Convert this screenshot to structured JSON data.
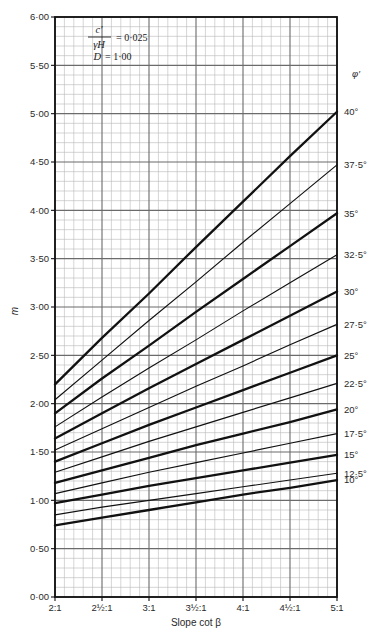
{
  "chart_data": {
    "type": "line",
    "title": "",
    "xlabel": "Slope cot β",
    "ylabel": "m",
    "xlim": [
      2,
      5
    ],
    "ylim": [
      0,
      6
    ],
    "grid": true,
    "legend_position": "right-outside",
    "x_tick_labels": [
      "2:1",
      "2½:1",
      "3:1",
      "3½:1",
      "4:1",
      "4½:1",
      "5:1"
    ],
    "x_tick_values": [
      2,
      2.5,
      3,
      3.5,
      4,
      4.5,
      5
    ],
    "y_tick_labels": [
      "0·00",
      "0·50",
      "1·00",
      "1·50",
      "2·00",
      "2·50",
      "3·00",
      "3·50",
      "4·00",
      "4·50",
      "5·00",
      "5·50",
      "6·00"
    ],
    "y_tick_values": [
      0,
      0.5,
      1,
      1.5,
      2,
      2.5,
      3,
      3.5,
      4,
      4.5,
      5,
      5.5,
      6
    ],
    "y_major_step": 0.5,
    "y_minor_step": 0.1,
    "x_major_step": 0.5,
    "x_minor_step": 0.1,
    "legend_title": "φ′",
    "annotation": {
      "numerator": "c′",
      "denominator": "γH",
      "eq1": "= 0·025",
      "line2_symbol": "D",
      "line2_value": "= 1·00"
    },
    "series": [
      {
        "name": "40°",
        "label": "40°",
        "weight": "thick",
        "x": [
          2,
          2.5,
          3,
          3.5,
          4,
          4.5,
          5
        ],
        "values": [
          2.2,
          2.68,
          3.14,
          3.62,
          4.09,
          4.56,
          5.02
        ]
      },
      {
        "name": "37.5°",
        "label": "37·5°",
        "weight": "thin",
        "x": [
          2,
          2.5,
          3,
          3.5,
          4,
          4.5,
          5
        ],
        "values": [
          2.04,
          2.45,
          2.86,
          3.26,
          3.67,
          4.07,
          4.47
        ]
      },
      {
        "name": "35°",
        "label": "35°",
        "weight": "thick",
        "x": [
          2,
          2.5,
          3,
          3.5,
          4,
          4.5,
          5
        ],
        "values": [
          1.9,
          2.26,
          2.6,
          2.95,
          3.29,
          3.63,
          3.97
        ]
      },
      {
        "name": "32.5°",
        "label": "32·5°",
        "weight": "thin",
        "x": [
          2,
          2.5,
          3,
          3.5,
          4,
          4.5,
          5
        ],
        "values": [
          1.76,
          2.07,
          2.37,
          2.66,
          2.96,
          3.25,
          3.54
        ]
      },
      {
        "name": "30°",
        "label": "30°",
        "weight": "thick",
        "x": [
          2,
          2.5,
          3,
          3.5,
          4,
          4.5,
          5
        ],
        "values": [
          1.64,
          1.9,
          2.16,
          2.41,
          2.66,
          2.91,
          3.16
        ]
      },
      {
        "name": "27.5°",
        "label": "27·5°",
        "weight": "thin",
        "x": [
          2,
          2.5,
          3,
          3.5,
          4,
          4.5,
          5
        ],
        "values": [
          1.52,
          1.74,
          1.96,
          2.18,
          2.39,
          2.61,
          2.82
        ]
      },
      {
        "name": "25°",
        "label": "25°",
        "weight": "thick",
        "x": [
          2,
          2.5,
          3,
          3.5,
          4,
          4.5,
          5
        ],
        "values": [
          1.4,
          1.59,
          1.78,
          1.96,
          2.14,
          2.32,
          2.5
        ]
      },
      {
        "name": "22.5°",
        "label": "22·5°",
        "weight": "thin",
        "x": [
          2,
          2.5,
          3,
          3.5,
          4,
          4.5,
          5
        ],
        "values": [
          1.29,
          1.45,
          1.61,
          1.76,
          1.91,
          2.06,
          2.21
        ]
      },
      {
        "name": "20°",
        "label": "20°",
        "weight": "thick",
        "x": [
          2,
          2.5,
          3,
          3.5,
          4,
          4.5,
          5
        ],
        "values": [
          1.18,
          1.31,
          1.44,
          1.57,
          1.69,
          1.81,
          1.94
        ]
      },
      {
        "name": "17.5°",
        "label": "17·5°",
        "weight": "thin",
        "x": [
          2,
          2.5,
          3,
          3.5,
          4,
          4.5,
          5
        ],
        "values": [
          1.07,
          1.18,
          1.29,
          1.39,
          1.49,
          1.59,
          1.69
        ]
      },
      {
        "name": "15°",
        "label": "15°",
        "weight": "thick",
        "x": [
          2,
          2.5,
          3,
          3.5,
          4,
          4.5,
          5
        ],
        "values": [
          0.97,
          1.06,
          1.15,
          1.23,
          1.31,
          1.39,
          1.47
        ]
      },
      {
        "name": "12.5°",
        "label": "12·5°",
        "weight": "thin",
        "x": [
          2,
          2.5,
          3,
          3.5,
          4,
          4.5,
          5
        ],
        "values": [
          0.85,
          0.93,
          1.0,
          1.07,
          1.14,
          1.21,
          1.28
        ]
      },
      {
        "name": "10°",
        "label": "10°",
        "weight": "thick",
        "x": [
          2,
          2.5,
          3,
          3.5,
          4,
          4.5,
          5
        ],
        "values": [
          0.74,
          0.82,
          0.9,
          0.98,
          1.06,
          1.13,
          1.21
        ]
      }
    ]
  },
  "colors": {
    "curve": "#111111",
    "grid_major": "#6b6b6b",
    "grid_minor": "#b9b9b9",
    "axis": "#111111",
    "text": "#2a2a2a"
  }
}
